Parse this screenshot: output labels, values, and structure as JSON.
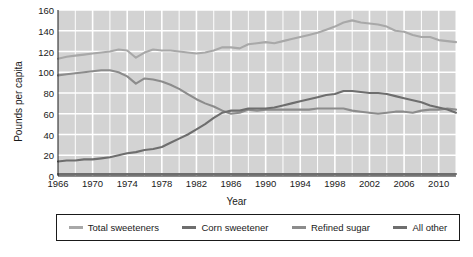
{
  "chart_data": {
    "type": "line",
    "title": "",
    "xlabel": "Year",
    "ylabel": "Pounds per capita",
    "xlim": [
      1966,
      2012
    ],
    "ylim": [
      0,
      160
    ],
    "ytick_values": [
      0,
      20,
      40,
      60,
      80,
      100,
      120,
      140,
      160
    ],
    "ytick_labels": [
      "0",
      "20",
      "40",
      "60",
      "80",
      "100",
      "120",
      "140",
      "160"
    ],
    "xtick_values": [
      1966,
      1970,
      1974,
      1978,
      1982,
      1986,
      1990,
      1994,
      1998,
      2002,
      2006,
      2010
    ],
    "xtick_labels": [
      "1966",
      "1970",
      "1974",
      "1978",
      "1982",
      "1986",
      "1990",
      "1994",
      "1998",
      "2002",
      "2006",
      "2010"
    ],
    "grid": true,
    "grid_color": "#ffffff",
    "plot_background": "#d3d3d3",
    "legend_position": "bottom",
    "x": [
      1966,
      1967,
      1968,
      1969,
      1970,
      1971,
      1972,
      1973,
      1974,
      1975,
      1976,
      1977,
      1978,
      1979,
      1980,
      1981,
      1982,
      1983,
      1984,
      1985,
      1986,
      1987,
      1988,
      1989,
      1990,
      1991,
      1992,
      1993,
      1994,
      1995,
      1996,
      1997,
      1998,
      1999,
      2000,
      2001,
      2002,
      2003,
      2004,
      2005,
      2006,
      2007,
      2008,
      2009,
      2010,
      2011,
      2012
    ],
    "series": [
      {
        "name": "Total sweeteners",
        "color": "#a8a8a8",
        "values": [
          113,
          115,
          116,
          117,
          118,
          119,
          120,
          122,
          121,
          114,
          119,
          122,
          121,
          121,
          120,
          119,
          118,
          119,
          121,
          124,
          124,
          123,
          127,
          128,
          129,
          128,
          130,
          132,
          134,
          136,
          138,
          141,
          144,
          148,
          150,
          148,
          147,
          146,
          144,
          140,
          139,
          136,
          134,
          134,
          131,
          130,
          129
        ]
      },
      {
        "name": "Corn sweetener",
        "color": "#6e6e6e",
        "values": [
          14,
          15,
          15,
          16,
          16,
          17,
          18,
          20,
          22,
          23,
          25,
          26,
          28,
          32,
          36,
          40,
          45,
          50,
          56,
          61,
          63,
          63,
          65,
          65,
          65,
          66,
          68,
          70,
          72,
          74,
          76,
          78,
          79,
          82,
          82,
          81,
          80,
          80,
          79,
          77,
          75,
          73,
          71,
          68,
          66,
          64,
          61
        ]
      },
      {
        "name": "Refined sugar",
        "color": "#8c8c8c",
        "values": [
          97,
          98,
          99,
          100,
          101,
          102,
          102,
          100,
          96,
          89,
          94,
          93,
          91,
          88,
          84,
          79,
          74,
          70,
          67,
          63,
          60,
          61,
          64,
          63,
          64,
          64,
          64,
          64,
          64,
          64,
          65,
          65,
          65,
          65,
          63,
          62,
          61,
          60,
          61,
          62,
          62,
          61,
          63,
          64,
          64,
          65,
          64
        ]
      },
      {
        "name": "All other",
        "color": "#6e6e6e",
        "values": [
          2,
          2,
          2,
          2,
          2,
          2,
          2,
          2,
          2,
          2,
          2,
          2,
          2,
          2,
          2,
          2,
          2,
          2,
          2,
          2,
          2,
          2,
          2,
          2,
          2,
          2,
          2,
          2,
          2,
          2,
          2,
          2,
          2,
          2,
          2,
          2,
          2,
          2,
          2,
          2,
          2,
          2,
          2,
          2,
          2,
          2,
          2
        ]
      }
    ]
  },
  "legend": {
    "items": [
      {
        "label": "Total sweeteners",
        "color": "#a8a8a8"
      },
      {
        "label": "Corn sweetener",
        "color": "#6e6e6e"
      },
      {
        "label": "Refined sugar",
        "color": "#8c8c8c"
      },
      {
        "label": "All other",
        "color": "#6e6e6e"
      }
    ]
  }
}
